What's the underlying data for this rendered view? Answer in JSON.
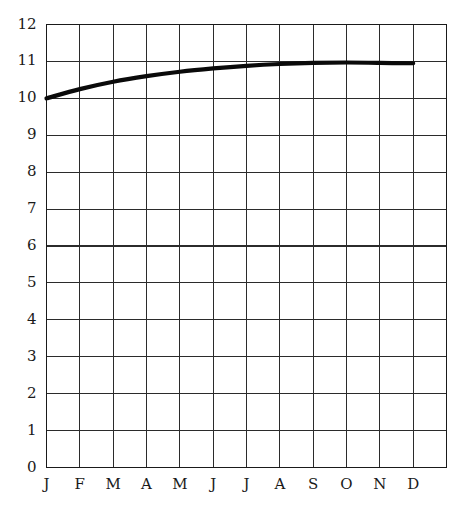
{
  "chart_data": {
    "type": "line",
    "title": "",
    "subtitle": "",
    "xlabel": "",
    "ylabel": "",
    "xlim": [
      0,
      12
    ],
    "ylim": [
      0,
      12
    ],
    "grid": true,
    "legend": null,
    "legend_position": "none",
    "categories": [
      "J",
      "F",
      "M",
      "A",
      "M",
      "J",
      "J",
      "A",
      "S",
      "O",
      "N",
      "D"
    ],
    "x_tick_labels": [
      "J",
      "F",
      "M",
      "A",
      "M",
      "J",
      "J",
      "A",
      "S",
      "O",
      "N",
      "D"
    ],
    "y_tick_labels": [
      "0",
      "1",
      "2",
      "3",
      "4",
      "5",
      "6",
      "7",
      "8",
      "9",
      "10",
      "11",
      "12"
    ],
    "y_ticks": [
      0,
      1,
      2,
      3,
      4,
      5,
      6,
      7,
      8,
      9,
      10,
      11,
      12
    ],
    "series": [
      {
        "name": "series-1",
        "color": "#0a0a0a",
        "values": [
          10.0,
          10.25,
          10.45,
          10.6,
          10.72,
          10.81,
          10.88,
          10.93,
          10.96,
          10.97,
          10.96,
          10.95
        ]
      }
    ],
    "annotations": []
  },
  "style": {
    "line_color": "#0a0a0a",
    "grid_color": "#2b2b2b",
    "frame_color": "#1a1a1a",
    "background": "#ffffff",
    "text_color": "#1a1a1a"
  }
}
